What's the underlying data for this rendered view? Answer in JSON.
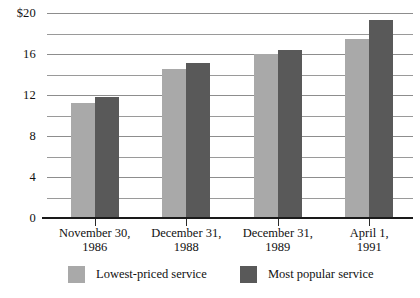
{
  "chart_data": {
    "type": "bar",
    "title": "",
    "subtitle": "",
    "xlabel": "",
    "ylabel": "",
    "categories": [
      "November 30,\n1986",
      "December 31,\n1988",
      "December 31,\n1989",
      "April 1,\n1991"
    ],
    "series": [
      {
        "name": "Lowest-priced service",
        "color": "#a9a9a9",
        "values": [
          11.2,
          14.5,
          16.0,
          17.5
        ]
      },
      {
        "name": "Most popular service",
        "color": "#595959",
        "values": [
          11.8,
          15.1,
          16.4,
          19.3
        ]
      }
    ],
    "ylim": [
      0,
      20
    ],
    "ytick_values": [
      0,
      2,
      4,
      6,
      8,
      10,
      12,
      14,
      16,
      18,
      20
    ],
    "ytick_labels": [
      "0",
      "",
      "4",
      "",
      "8",
      "",
      "12",
      "",
      "16",
      "",
      "$20"
    ],
    "grid": "horizontal",
    "legend_position": "bottom"
  },
  "legend": {
    "items": [
      {
        "label": "Lowest-priced service"
      },
      {
        "label": "Most popular service"
      }
    ]
  }
}
